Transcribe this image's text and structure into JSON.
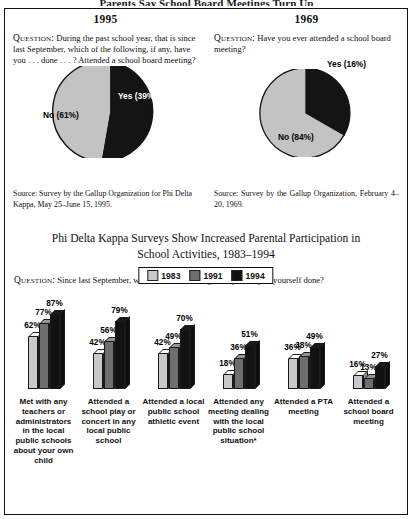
{
  "top_title_clipped": "Parents Say School Board Meetings Turn Up",
  "panels": [
    {
      "year": "1995",
      "question_label": "Question:",
      "question": "During the past school year, that is since last September, which of the following, if any, have you . . . done . . . ? Attended a school board meeting?",
      "source": "Source: Survey by the Gallup Organization for Phi Delta Kappa, May 25–June 15, 1995.",
      "pie": {
        "slices": [
          {
            "label": "Yes (39%)",
            "value": 39,
            "color": "#111111",
            "text_color": "white"
          },
          {
            "label": "No (61%)",
            "value": 61,
            "color": "#c3c3c3",
            "text_color": "black"
          }
        ]
      }
    },
    {
      "year": "1969",
      "question_label": "Question:",
      "question": "Have you ever attended a school board meeting?",
      "source": "Source: Survey by the Gallup Organization, February 4–20, 1969.",
      "pie": {
        "slices": [
          {
            "label": "Yes (16%)",
            "value": 16,
            "color": "#111111",
            "text_color": "black"
          },
          {
            "label": "No (84%)",
            "value": 84,
            "color": "#c3c3c3",
            "text_color": "black"
          }
        ]
      }
    }
  ],
  "bottom": {
    "title_line1": "Phi Delta Kappa Surveys Show Increased Parental Participation in",
    "title_line2": "School Activities, 1983–1994",
    "question_label": "Question:",
    "question": "Since last September, which of the following, if any, have you yourself done?"
  },
  "chart_data": {
    "type": "bar",
    "title": "Phi Delta Kappa Surveys Show Increased Parental Participation in School Activities, 1983–1994",
    "xlabel": "",
    "ylabel": "",
    "ylim": [
      0,
      100
    ],
    "grid": false,
    "legend_position": "top-center",
    "categories": [
      "Met with any teachers or administrators in the local public schools about your own child",
      "Attended a school play or concert in any local public school",
      "Attended a local public school athletic event",
      "Attended any meeting dealing with the local public school situation*",
      "Attended a PTA meeting",
      "Attended a school board meeting"
    ],
    "series": [
      {
        "name": "1983",
        "color": "#c9c9c9",
        "values": [
          62,
          42,
          42,
          18,
          36,
          16
        ]
      },
      {
        "name": "1991",
        "color": "#6e6e6e",
        "values": [
          77,
          56,
          49,
          36,
          38,
          13
        ]
      },
      {
        "name": "1994",
        "color": "#121212",
        "values": [
          87,
          79,
          70,
          51,
          49,
          27
        ]
      }
    ],
    "value_labels": [
      [
        "62%",
        "77%",
        "87%"
      ],
      [
        "42%",
        "56%",
        "79%"
      ],
      [
        "42%",
        "49%",
        "70%"
      ],
      [
        "18%",
        "36%",
        "51%"
      ],
      [
        "36%",
        "38%",
        "49%"
      ],
      [
        "16%",
        "13%",
        "27%"
      ]
    ]
  }
}
